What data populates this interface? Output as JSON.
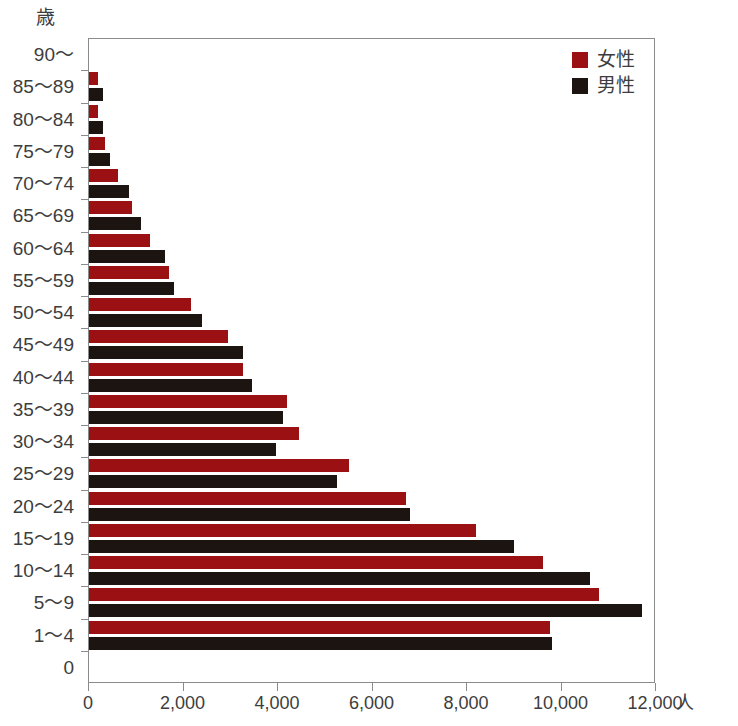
{
  "chart_data": {
    "type": "bar",
    "title": "",
    "subtitle": "",
    "orientation": "horizontal",
    "xlabel": "人",
    "ylabel": "歳",
    "xlim": [
      0,
      12000
    ],
    "grid": false,
    "legend_position": "top-right",
    "x_ticks": [
      0,
      2000,
      4000,
      6000,
      8000,
      10000,
      12000
    ],
    "x_tick_labels": [
      "0",
      "2,000",
      "4,000",
      "6,000",
      "8,000",
      "10,000",
      "12,000"
    ],
    "categories": [
      "90～",
      "85～89",
      "80～84",
      "75～79",
      "70～74",
      "65～69",
      "60～64",
      "55～59",
      "50～54",
      "45～49",
      "40～44",
      "35～39",
      "30～34",
      "25～29",
      "20～24",
      "15～19",
      "10～14",
      "5～9",
      "1～4",
      "0"
    ],
    "series": [
      {
        "name": "女性",
        "color": "#9b1012",
        "values": [
          0,
          200,
          180,
          330,
          620,
          900,
          1300,
          1700,
          2150,
          2950,
          3250,
          4200,
          4450,
          5500,
          6700,
          8200,
          9600,
          10800,
          9750,
          0
        ]
      },
      {
        "name": "男性",
        "color": "#1c1410",
        "values": [
          0,
          300,
          300,
          450,
          850,
          1100,
          1600,
          1800,
          2400,
          3250,
          3450,
          4100,
          3950,
          5250,
          6800,
          9000,
          10600,
          11700,
          9800,
          0
        ]
      }
    ]
  },
  "legend": {
    "items": [
      {
        "label": "女性",
        "color": "#9b1012"
      },
      {
        "label": "男性",
        "color": "#1c1410"
      }
    ]
  },
  "axes": {
    "y_unit": "歳",
    "x_unit": "人"
  }
}
